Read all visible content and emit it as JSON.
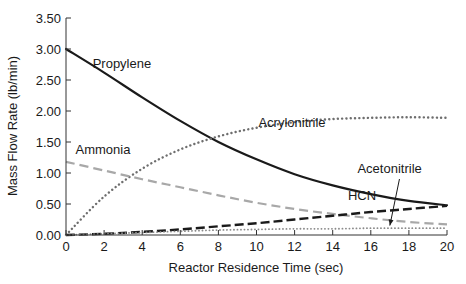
{
  "chart_data": {
    "type": "line",
    "title": "",
    "xlabel": "Reactor Residence Time (sec)",
    "ylabel": "Mass Flow Rate (lb/min)",
    "xlim": [
      0,
      20
    ],
    "ylim": [
      0,
      3.5
    ],
    "xticks": [
      0,
      2,
      4,
      6,
      8,
      10,
      12,
      14,
      16,
      18,
      20
    ],
    "xtick_labels": [
      "0",
      "2",
      "4",
      "6",
      "8",
      "10",
      "12",
      "14",
      "16",
      "18",
      "20"
    ],
    "yticks": [
      0,
      0.5,
      1.0,
      1.5,
      2.0,
      2.5,
      3.0,
      3.5
    ],
    "ytick_labels": [
      "0.00",
      "0.50",
      "1.00",
      "1.50",
      "2.00",
      "2.50",
      "3.00",
      "3.50"
    ],
    "grid": false,
    "legend": "inline labels",
    "x": [
      0,
      2,
      4,
      6,
      8,
      10,
      12,
      14,
      16,
      18,
      20
    ],
    "series": [
      {
        "name": "Propylene",
        "style": "solid",
        "color": "#1a1a1a",
        "values": [
          3.0,
          2.62,
          2.22,
          1.84,
          1.5,
          1.22,
          0.98,
          0.8,
          0.66,
          0.55,
          0.48
        ]
      },
      {
        "name": "Acrylonitrile",
        "style": "dotted",
        "color": "#6e6e6e",
        "values": [
          0.0,
          0.62,
          1.07,
          1.38,
          1.59,
          1.73,
          1.82,
          1.87,
          1.89,
          1.9,
          1.89
        ]
      },
      {
        "name": "Ammonia",
        "style": "dashed",
        "color": "#a8a8a8",
        "values": [
          1.18,
          1.04,
          0.9,
          0.77,
          0.64,
          0.52,
          0.42,
          0.34,
          0.27,
          0.21,
          0.17
        ]
      },
      {
        "name": "HCN",
        "style": "dashed",
        "color": "#1a1a1a",
        "values": [
          0.0,
          0.02,
          0.05,
          0.09,
          0.14,
          0.19,
          0.25,
          0.31,
          0.37,
          0.42,
          0.47
        ]
      },
      {
        "name": "Acetonitrile",
        "style": "dotted",
        "color": "#8a8a8a",
        "values": [
          0.0,
          0.02,
          0.04,
          0.06,
          0.08,
          0.09,
          0.1,
          0.1,
          0.11,
          0.11,
          0.11
        ]
      }
    ],
    "annotations": [
      {
        "text": "Propylene",
        "x": 1.4,
        "y": 2.7
      },
      {
        "text": "Acrylonitrile",
        "x": 10.1,
        "y": 1.75
      },
      {
        "text": "Ammonia",
        "x": 0.5,
        "y": 1.3
      },
      {
        "text": "Acetonitrile",
        "x": 15.3,
        "y": 1.0,
        "arrow_to": [
          17.0,
          0.12
        ]
      },
      {
        "text": "HCN",
        "x": 14.8,
        "y": 0.56
      }
    ]
  }
}
